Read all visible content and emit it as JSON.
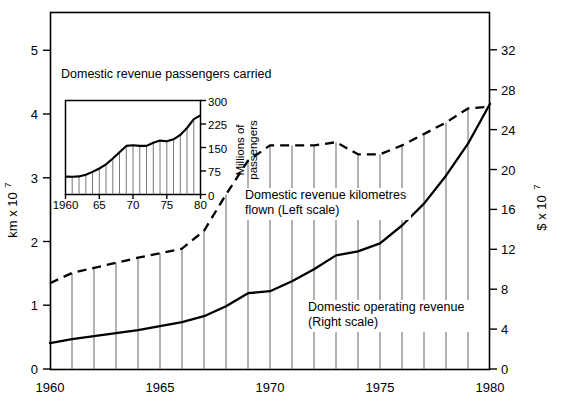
{
  "chart_data": {
    "type": "line",
    "title": "",
    "xlabel": "",
    "x": [
      1960,
      1961,
      1962,
      1963,
      1964,
      1965,
      1966,
      1967,
      1968,
      1969,
      1970,
      1971,
      1972,
      1973,
      1974,
      1975,
      1976,
      1977,
      1978,
      1979,
      1980
    ],
    "xlim": [
      1960,
      1980
    ],
    "xticks": [
      1960,
      1965,
      1970,
      1975,
      1980
    ],
    "xtick_labels": [
      "1960",
      "1965",
      "1970",
      "1975",
      "1980"
    ],
    "grid": false,
    "legend": "inline-annotations",
    "axes": [
      {
        "side": "left",
        "label": "km x 10",
        "label_exponent": "7",
        "ylim": [
          0,
          5.6
        ],
        "ticks": [
          0,
          1,
          2,
          3,
          4,
          5
        ],
        "tick_labels": [
          "0",
          "1",
          "2",
          "3",
          "4",
          "5"
        ]
      },
      {
        "side": "right",
        "label": "$ x 10",
        "label_exponent": "7",
        "ylim": [
          0,
          35.8
        ],
        "ticks": [
          0,
          4,
          8,
          12,
          16,
          20,
          24,
          28,
          32
        ],
        "tick_labels": [
          "0",
          "4",
          "8",
          "12",
          "16",
          "20",
          "24",
          "28",
          "32"
        ]
      }
    ],
    "series": [
      {
        "name": "Domestic revenue kilometres flown",
        "scale": "left",
        "style": "dashed",
        "unit": "km x 10^7",
        "values": [
          1.35,
          1.32,
          1.4,
          1.48,
          1.56,
          1.63,
          1.7,
          1.98,
          2.55,
          3.08,
          3.32,
          3.32,
          3.32,
          3.37,
          3.18,
          3.18,
          3.32,
          3.5,
          3.68,
          3.9,
          3.93
        ]
      },
      {
        "name": "Domestic operating revenue",
        "scale": "right",
        "style": "solid",
        "unit": "$ x 10^7",
        "values": [
          2.6,
          3.0,
          3.3,
          3.6,
          3.9,
          4.3,
          4.7,
          5.3,
          6.3,
          7.6,
          7.8,
          8.8,
          10.0,
          11.4,
          11.8,
          12.6,
          14.4,
          16.6,
          19.4,
          22.6,
          26.6
        ]
      }
    ],
    "annotations": [
      {
        "name": "dashed-series-label",
        "line1": "Domestic revenue kilometres",
        "line2": "flown  (Left scale)"
      },
      {
        "name": "solid-series-label",
        "line1": "Domestic operating revenue",
        "line2": "(Right scale)"
      }
    ],
    "inset": {
      "type": "line",
      "title": "Domestic revenue passengers carried",
      "x": [
        1960,
        1961,
        1962,
        1963,
        1964,
        1965,
        1966,
        1967,
        1968,
        1969,
        1970,
        1971,
        1972,
        1973,
        1974,
        1975,
        1976,
        1977,
        1978,
        1979,
        1980
      ],
      "xlim": [
        1960,
        1980
      ],
      "xticks": [
        1960,
        1965,
        1970,
        1975,
        1980
      ],
      "xtick_labels": [
        "1960",
        "65",
        "70",
        "75",
        "80"
      ],
      "ylabel": "Millions of passengers",
      "ylim": [
        0,
        300
      ],
      "yticks": [
        0,
        75,
        150,
        225,
        300
      ],
      "ytick_labels": [
        "0",
        "75",
        "150",
        "225",
        "300"
      ],
      "values": [
        57,
        58,
        63,
        72,
        83,
        96,
        115,
        135,
        155,
        157,
        155,
        155,
        165,
        172,
        170,
        176,
        190,
        212,
        240,
        275,
        287
      ]
    }
  }
}
